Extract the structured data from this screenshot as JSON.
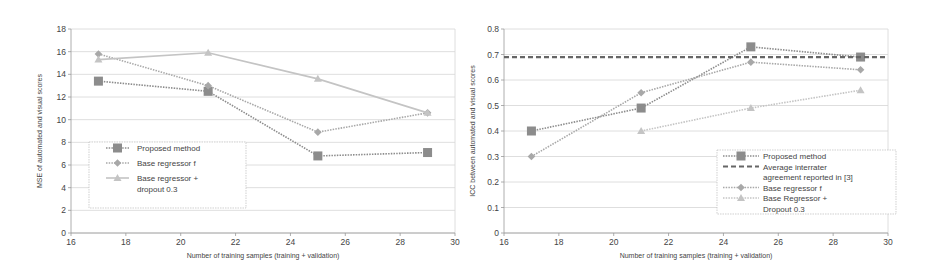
{
  "chart_data": [
    {
      "type": "line",
      "title": "",
      "xlabel": "Number of training samples (training + validation)",
      "ylabel": "MSE of automated and visual scores",
      "xlim": [
        16,
        30
      ],
      "ylim": [
        0,
        18
      ],
      "xticks": [
        16,
        18,
        20,
        22,
        24,
        26,
        28,
        30
      ],
      "yticks": [
        0,
        2,
        4,
        6,
        8,
        10,
        12,
        14,
        16,
        18
      ],
      "grid": true,
      "legend_position": "lower-left (inside)",
      "x": [
        17,
        21,
        25,
        29
      ],
      "series": [
        {
          "name": "Proposed method",
          "values": [
            13.4,
            12.5,
            6.8,
            7.1
          ],
          "marker": "square",
          "style": "dotted",
          "color": "#8c8c8c"
        },
        {
          "name": "Base regressor f",
          "values": [
            15.8,
            13.0,
            8.9,
            10.6
          ],
          "marker": "diamond",
          "style": "dotted",
          "color": "#a8a8a8"
        },
        {
          "name": "Base regressor + dropout 0.3",
          "values": [
            15.3,
            15.9,
            13.6,
            10.6
          ],
          "marker": "triangle",
          "style": "solid",
          "color": "#c4c4c4"
        }
      ],
      "legend_lines": [
        [
          "Proposed method"
        ],
        [
          "Base regressor f"
        ],
        [
          "Base regressor +",
          "dropout 0.3"
        ]
      ]
    },
    {
      "type": "line",
      "title": "",
      "xlabel": "Number of training samples (training + validation)",
      "ylabel": "ICC between automated and visual scores",
      "xlim": [
        16,
        30
      ],
      "ylim": [
        0,
        0.8
      ],
      "xticks": [
        16,
        18,
        20,
        22,
        24,
        26,
        28,
        30
      ],
      "yticks": [
        0,
        0.1,
        0.2,
        0.3,
        0.4,
        0.5,
        0.6,
        0.7,
        0.8
      ],
      "grid": true,
      "legend_position": "lower-right (inside)",
      "x": [
        17,
        21,
        25,
        29
      ],
      "series": [
        {
          "name": "Proposed method",
          "values": [
            0.4,
            0.49,
            0.73,
            0.69
          ],
          "marker": "square",
          "style": "dotted",
          "color": "#8c8c8c"
        },
        {
          "name": "Average interrater agreement reported in [3]",
          "values": [
            0.69,
            0.69,
            0.69,
            0.69
          ],
          "marker": "none",
          "style": "dashed",
          "color": "#666666",
          "horizontal_line": 0.69
        },
        {
          "name": "Base regressor f",
          "values": [
            0.3,
            0.55,
            0.67,
            0.64
          ],
          "marker": "diamond",
          "style": "dotted",
          "color": "#a8a8a8"
        },
        {
          "name": "Base Regressor + Dropout 0.3",
          "values": [
            null,
            0.4,
            0.49,
            0.56
          ],
          "marker": "triangle",
          "style": "dotted",
          "color": "#c4c4c4"
        }
      ],
      "legend_lines": [
        [
          "Proposed method"
        ],
        [
          "Average interrater",
          "agreement reported in [3]"
        ],
        [
          "Base regressor f"
        ],
        [
          "Base Regressor +",
          "Dropout 0.3"
        ]
      ]
    }
  ],
  "layout": {
    "panels": [
      {
        "left": 71,
        "top": 29,
        "right": 455,
        "bottom": 233,
        "legend": {
          "x": 89,
          "y": 142,
          "w": 157,
          "h": 66
        }
      },
      {
        "left": 504,
        "top": 29,
        "right": 888,
        "bottom": 233,
        "legend": {
          "x": 717,
          "y": 150,
          "w": 179,
          "h": 64
        }
      }
    ]
  }
}
